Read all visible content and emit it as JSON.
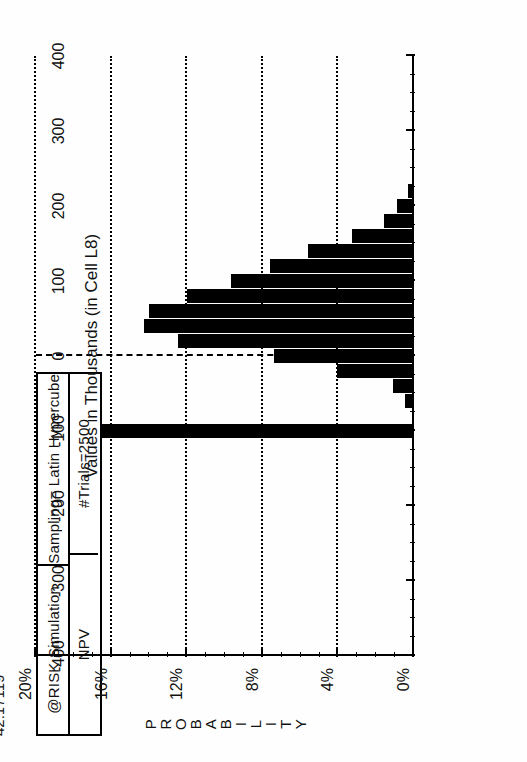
{
  "figure": {
    "note": "Expected\nResult=\n42.17119",
    "header": {
      "title_left": "@RISK Simulation",
      "title_right": "Sampling= Latin Hypercube",
      "sub_left": "NPV",
      "sub_right": "#Trials=2500"
    }
  },
  "chart_data": {
    "type": "bar",
    "title": "@RISK Simulation",
    "subtitle": "NPV",
    "xlabel": "Values in Thousands (in Cell L8)",
    "ylabel": "PROBABILITY",
    "ylabel_letters": [
      "P",
      "R",
      "O",
      "B",
      "A",
      "B",
      "I",
      "L",
      "I",
      "T",
      "Y"
    ],
    "orientation": "rotated-90-ccw",
    "grid": "horizontal-dotted",
    "legend": "none",
    "xlim": [
      -400,
      400
    ],
    "ylim": [
      0,
      20
    ],
    "xticks": [
      -400,
      -300,
      -200,
      -100,
      0,
      100,
      200,
      300,
      400
    ],
    "xticklabels": [
      "-400",
      "-300",
      "-200",
      "-100",
      "0",
      "100",
      "200",
      "300",
      "400"
    ],
    "yticks": [
      0,
      4,
      8,
      12,
      16,
      20
    ],
    "yticklabels": [
      "0%",
      "4%",
      "8%",
      "12%",
      "16%",
      "20%"
    ],
    "bar_width": 20,
    "zero_reference_line": 0,
    "x": [
      -100,
      -60,
      -40,
      -20,
      0,
      20,
      40,
      60,
      80,
      100,
      120,
      140,
      160,
      180,
      200,
      220
    ],
    "values": [
      16.5,
      0.5,
      1.1,
      4.1,
      7.4,
      12.5,
      14.3,
      14.0,
      12.0,
      9.7,
      7.6,
      5.6,
      3.3,
      1.6,
      0.9,
      0.3
    ],
    "annotations": [
      {
        "label": "Expected Result=",
        "value": "42.17119"
      },
      {
        "label": "Sampling=",
        "value": "Latin Hypercube"
      },
      {
        "label": "#Trials=",
        "value": "2500"
      }
    ]
  }
}
